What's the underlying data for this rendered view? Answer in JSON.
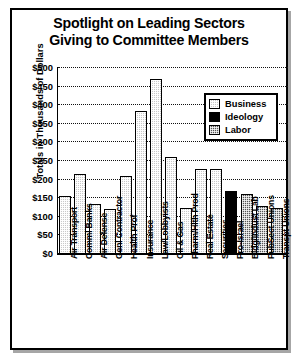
{
  "chart_data": {
    "type": "bar",
    "title": "Spotlight on Leading Sectors Giving to Committee Members",
    "title_lines": [
      "Spotlight on Leading Sectors",
      "Giving to Committee Members"
    ],
    "xlabel": "",
    "ylabel": "Totals in Thousands of Dollars",
    "ylim": [
      0,
      500
    ],
    "ytick_labels": [
      "$500",
      "$450",
      "$400",
      "$350",
      "$300",
      "$250",
      "$200",
      "$150",
      "$100",
      "$50",
      "$0"
    ],
    "ytick_values": [
      500,
      450,
      400,
      350,
      300,
      250,
      200,
      150,
      100,
      50,
      0
    ],
    "grid": true,
    "legend_position": "upper-right",
    "categories": [
      "Air Transport",
      "Comml Banks",
      "Air Defense",
      "Genl Contractor",
      "Health Prof",
      "Insurance",
      "Law/Lobbyists",
      "Oil & Gas",
      "Pharm/Hlth Prod",
      "Real Estate",
      "Securities",
      "Pro-Israel",
      "Bldg/Indust Lab",
      "PubSect Unions",
      "Transpt Unions"
    ],
    "values": [
      155,
      215,
      135,
      122,
      210,
      385,
      470,
      260,
      125,
      228,
      228,
      170,
      160,
      130,
      125
    ],
    "groups": [
      "Business",
      "Business",
      "Business",
      "Business",
      "Business",
      "Business",
      "Business",
      "Business",
      "Business",
      "Business",
      "Business",
      "Ideology",
      "Labor",
      "Labor",
      "Labor"
    ],
    "legend": [
      {
        "label": "Business",
        "key": "business",
        "color": "#c9c9c9"
      },
      {
        "label": "Ideology",
        "key": "ideology",
        "color": "#000000"
      },
      {
        "label": "Labor",
        "key": "labor",
        "color": "#555555"
      }
    ]
  }
}
